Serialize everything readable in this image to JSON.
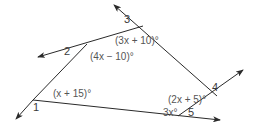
{
  "diagram": {
    "type": "polygon-exterior-angles",
    "stroke_color": "#2a2a2a",
    "vertices": [
      {
        "id": "1",
        "x": 33,
        "y": 100
      },
      {
        "id": "2",
        "x": 87,
        "y": 44
      },
      {
        "id": "3",
        "x": 143,
        "y": 26
      },
      {
        "id": "4",
        "x": 217,
        "y": 96
      },
      {
        "id": "5",
        "x": 178,
        "y": 116
      }
    ],
    "exterior_angle_labels": [
      {
        "id": "1",
        "text": "1"
      },
      {
        "id": "2",
        "text": "2"
      },
      {
        "id": "3",
        "text": "3"
      },
      {
        "id": "4",
        "text": "4"
      },
      {
        "id": "5",
        "text": "5"
      }
    ],
    "interior_angle_expressions": {
      "v1": "(x + 15)°",
      "v2": "(4x − 10)°",
      "v3": "(3x + 10)°",
      "v4": "(2x + 5)°",
      "v5": "3x°"
    }
  }
}
